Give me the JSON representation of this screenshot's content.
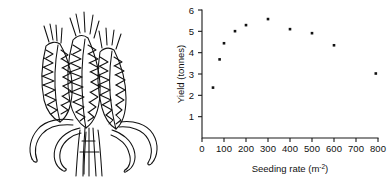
{
  "figure": {
    "illustration": {
      "name": "wheat-ears-line-drawing",
      "description": "Black-and-white line drawing of three wheat ears with awns on stems with curved leaves"
    }
  },
  "chart_data": {
    "type": "scatter",
    "title": "",
    "xlabel_text": "Seeding rate (m",
    "xlabel_sup": "-2",
    "xlabel_close": ")",
    "xlabel": "Seeding rate (m-2)",
    "ylabel": "Yield (tonnes)",
    "x": [
      50,
      80,
      100,
      150,
      200,
      300,
      400,
      500,
      600,
      790
    ],
    "y": [
      2.5,
      3.9,
      4.7,
      5.3,
      5.6,
      5.9,
      5.4,
      5.2,
      4.6,
      3.2
    ],
    "points": [
      {
        "x": 50,
        "y": 2.5
      },
      {
        "x": 80,
        "y": 3.9
      },
      {
        "x": 100,
        "y": 4.7
      },
      {
        "x": 150,
        "y": 5.3
      },
      {
        "x": 200,
        "y": 5.6
      },
      {
        "x": 300,
        "y": 5.9
      },
      {
        "x": 400,
        "y": 5.4
      },
      {
        "x": 500,
        "y": 5.2
      },
      {
        "x": 600,
        "y": 4.6
      },
      {
        "x": 790,
        "y": 3.2
      }
    ],
    "xlim": [
      0,
      800
    ],
    "ylim": [
      0,
      6.35
    ],
    "xticks": [
      0,
      100,
      200,
      300,
      400,
      500,
      600,
      700,
      800
    ],
    "xticklabels": [
      "0",
      "100",
      "200",
      "300",
      "400",
      "500",
      "600",
      "700",
      "800"
    ],
    "yticks": [
      1,
      2,
      3,
      4,
      5,
      6
    ],
    "yticklabels": [
      "1",
      "2",
      "3",
      "4",
      "5",
      "6"
    ],
    "grid": false,
    "legend": null,
    "marker": "square",
    "marker_color": "#121212"
  }
}
